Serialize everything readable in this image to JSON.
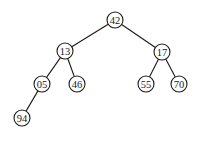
{
  "diagram": {
    "type": "binary-tree",
    "nodes": [
      {
        "id": "n42",
        "label": "42",
        "x": 115,
        "y": 20
      },
      {
        "id": "n13",
        "label": "13",
        "x": 65,
        "y": 51
      },
      {
        "id": "n17",
        "label": "17",
        "x": 162,
        "y": 52
      },
      {
        "id": "n05",
        "label": "05",
        "x": 42,
        "y": 84
      },
      {
        "id": "n46",
        "label": "46",
        "x": 77,
        "y": 84
      },
      {
        "id": "n55",
        "label": "55",
        "x": 146,
        "y": 84
      },
      {
        "id": "n70",
        "label": "70",
        "x": 179,
        "y": 84
      },
      {
        "id": "n94",
        "label": "94",
        "x": 22,
        "y": 118
      }
    ],
    "edges": [
      {
        "from": "n42",
        "to": "n13"
      },
      {
        "from": "n42",
        "to": "n17"
      },
      {
        "from": "n13",
        "to": "n05"
      },
      {
        "from": "n13",
        "to": "n46"
      },
      {
        "from": "n17",
        "to": "n55"
      },
      {
        "from": "n17",
        "to": "n70"
      },
      {
        "from": "n05",
        "to": "n94"
      }
    ],
    "node_radius": 8
  }
}
